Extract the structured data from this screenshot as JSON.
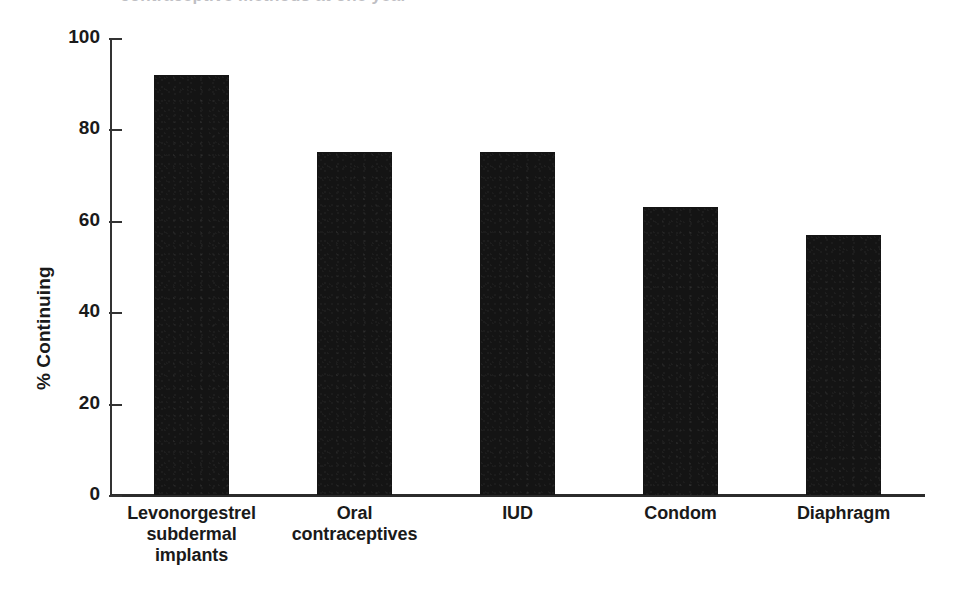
{
  "figure": {
    "clipped_header_remnant": "contraceptive methods at one year",
    "background_color": "#ffffff",
    "bar_color": "#141414",
    "axis_color": "#2b2b2b"
  },
  "chart_data": {
    "type": "bar",
    "title": "",
    "xlabel": "",
    "ylabel": "% Continuing",
    "ylim": [
      0,
      100
    ],
    "yticks": [
      0,
      20,
      40,
      60,
      80,
      100
    ],
    "ytick_labels": [
      "0",
      "20",
      "40",
      "60",
      "80",
      "100"
    ],
    "grid": false,
    "legend": false,
    "categories": [
      "Levonorgestrel subdermal implants",
      "Oral contraceptives",
      "IUD",
      "Condom",
      "Diaphragm"
    ],
    "category_label_lines": [
      [
        "Levonorgestrel",
        "subdermal",
        "implants"
      ],
      [
        "Oral",
        "contraceptives"
      ],
      [
        "IUD"
      ],
      [
        "Condom"
      ],
      [
        "Diaphragm"
      ]
    ],
    "values": [
      92,
      75,
      75,
      63,
      57
    ],
    "series": [
      {
        "name": "% Continuing",
        "values": [
          92,
          75,
          75,
          63,
          57
        ]
      }
    ]
  }
}
